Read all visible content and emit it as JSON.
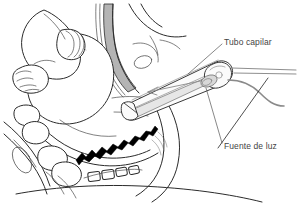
{
  "figure": {
    "kind": "medical-line-illustration",
    "language": "es",
    "background_color": "#ffffff",
    "ink_color": "#2b2b2b",
    "shade_color": "#b4b4b4",
    "accent_black": "#000000",
    "cable_color": "#8a8a8a",
    "label_color": "#444444",
    "width": 299,
    "height": 204
  },
  "labels": [
    {
      "id": "tubo-capilar",
      "text": "Tubo capilar",
      "x": 224,
      "y": 38,
      "leader_from": [
        222,
        44
      ],
      "leader_to": [
        188,
        74
      ]
    },
    {
      "id": "fuente-de-luz",
      "text": "Fuente de luz",
      "x": 224,
      "y": 142,
      "leader_from": [
        222,
        143
      ],
      "leader_to": [
        206,
        88
      ]
    }
  ],
  "parts": [
    {
      "id": "fetal-arm-hand",
      "label": "Brazo y mano fetal"
    },
    {
      "id": "fetal-head",
      "label": "Cabeza fetal"
    },
    {
      "id": "uterine-wall",
      "label": "Pared uterina"
    },
    {
      "id": "sacrum-vertebrae",
      "label": "Sacro y vertebras"
    },
    {
      "id": "cervix-band",
      "label": "Banda cervical"
    },
    {
      "id": "capillary-tube",
      "label": "Tubo capilar"
    },
    {
      "id": "light-source-bulb",
      "label": "Fuente de luz"
    },
    {
      "id": "light-cable",
      "label": "Cable de fibra optica"
    }
  ]
}
